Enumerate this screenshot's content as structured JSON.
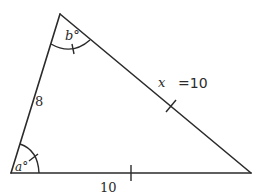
{
  "diagram": {
    "type": "triangle",
    "vertices": {
      "top": {
        "x": 60,
        "y": 14
      },
      "bottom_left": {
        "x": 11,
        "y": 173
      },
      "bottom_right": {
        "x": 251,
        "y": 173
      }
    },
    "labels": {
      "left_side": "8",
      "bottom_side": "10",
      "right_side_var": "x",
      "right_side_annotation": "=10",
      "angle_top": "b°",
      "angle_bottom_left": "a°"
    },
    "marks": {
      "bottom_side_tick": 1,
      "right_side_tick": 1,
      "angle_top_tick": 1,
      "angle_bottom_left_tick": 1
    },
    "colors": {
      "stroke": "#2b2b2b",
      "background": "#ffffff"
    }
  }
}
